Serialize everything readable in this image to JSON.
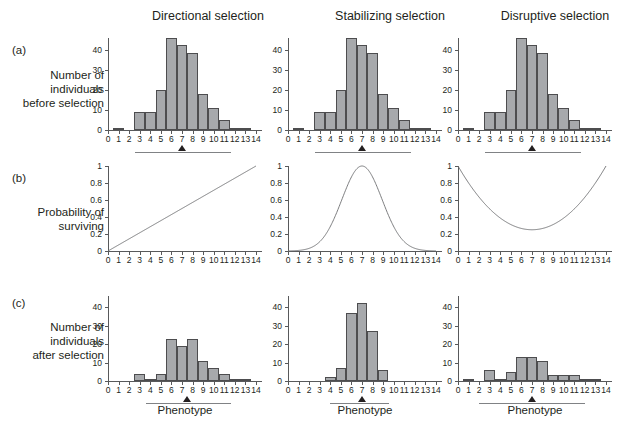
{
  "figure": {
    "columns": [
      {
        "id": "directional",
        "title": "Directional selection"
      },
      {
        "id": "stabilizing",
        "title": "Stabilizing selection"
      },
      {
        "id": "disruptive",
        "title": "Disruptive selection"
      }
    ],
    "rows": [
      {
        "tag": "(a)",
        "label_lines": [
          "Number of",
          "individuals",
          "before selection"
        ]
      },
      {
        "tag": "(b)",
        "label_lines": [
          "Probability of",
          "surviving"
        ]
      },
      {
        "tag": "(c)",
        "label_lines": [
          "Number of",
          "individuals",
          "after selection"
        ]
      }
    ],
    "xaxis_title": "Phenotype",
    "colors": {
      "bar_fill": "#a7a9ac",
      "bar_stroke": "#4d4d4f",
      "axis": "#58595b",
      "curve": "#6d6e71",
      "text": "#231f20"
    }
  },
  "chart_data": [
    {
      "id": "a-directional",
      "type": "bar",
      "title": "Directional selection",
      "row": "(a)",
      "ylabel": "Number of individuals before selection",
      "xlabel": "",
      "categories": [
        0,
        1,
        2,
        3,
        4,
        5,
        6,
        7,
        8,
        9,
        10,
        11,
        12,
        13,
        14
      ],
      "values": [
        0,
        1,
        0,
        9,
        9,
        20,
        46,
        42.5,
        38.5,
        18,
        11,
        5,
        1,
        1,
        0
      ],
      "ylim": [
        0,
        46
      ],
      "yticks": [
        0,
        10,
        20,
        30,
        40
      ],
      "mean_marker": 7,
      "range_bar": [
        2.6,
        11.6
      ],
      "grid": false
    },
    {
      "id": "a-stabilizing",
      "type": "bar",
      "title": "Stabilizing selection",
      "row": "(a)",
      "ylabel": "Number of individuals before selection",
      "xlabel": "",
      "categories": [
        0,
        1,
        2,
        3,
        4,
        5,
        6,
        7,
        8,
        9,
        10,
        11,
        12,
        13,
        14
      ],
      "values": [
        0,
        1,
        0,
        9,
        9,
        20,
        46,
        42.5,
        38.5,
        18,
        11,
        5,
        1,
        1,
        0
      ],
      "ylim": [
        0,
        46
      ],
      "yticks": [
        0,
        10,
        20,
        30,
        40
      ],
      "mean_marker": 7,
      "range_bar": [
        2.6,
        11.6
      ],
      "grid": false
    },
    {
      "id": "a-disruptive",
      "type": "bar",
      "title": "Disruptive selection",
      "row": "(a)",
      "ylabel": "Number of individuals before selection",
      "xlabel": "",
      "categories": [
        0,
        1,
        2,
        3,
        4,
        5,
        6,
        7,
        8,
        9,
        10,
        11,
        12,
        13,
        14
      ],
      "values": [
        0,
        1,
        0,
        9,
        9,
        20,
        46,
        42.5,
        38.5,
        18,
        11,
        5,
        1,
        1,
        0
      ],
      "ylim": [
        0,
        46
      ],
      "yticks": [
        0,
        10,
        20,
        30,
        40
      ],
      "mean_marker": 7,
      "range_bar": [
        2.6,
        11.6
      ],
      "grid": false
    },
    {
      "id": "b-directional",
      "type": "line",
      "title": "Directional selection",
      "row": "(b)",
      "ylabel": "Probability of surviving",
      "xlabel": "",
      "curve": "linear-increasing",
      "x": [
        0,
        1,
        2,
        3,
        4,
        5,
        6,
        7,
        8,
        9,
        10,
        11,
        12,
        13,
        14
      ],
      "values": [
        0,
        0.071,
        0.143,
        0.214,
        0.286,
        0.357,
        0.429,
        0.5,
        0.571,
        0.643,
        0.714,
        0.786,
        0.857,
        0.929,
        1.0
      ],
      "ylim": [
        0,
        1
      ],
      "yticks": [
        0,
        0.2,
        0.4,
        0.6,
        0.8,
        1
      ],
      "ytick_labels": [
        "0",
        "0.2",
        "0.4",
        "0.6",
        "0.8",
        "1"
      ],
      "grid": false
    },
    {
      "id": "b-stabilizing",
      "type": "line",
      "title": "Stabilizing selection",
      "row": "(b)",
      "ylabel": "Probability of surviving",
      "xlabel": "",
      "curve": "gaussian-peak",
      "peak_x": 7,
      "peak_y": 1.0,
      "sigma": 1.9,
      "x": [
        0,
        1,
        2,
        3,
        4,
        5,
        6,
        7,
        8,
        9,
        10,
        11,
        12,
        13,
        14
      ],
      "values": [
        0.002,
        0.012,
        0.056,
        0.175,
        0.404,
        0.714,
        0.958,
        1.0,
        0.958,
        0.714,
        0.404,
        0.175,
        0.056,
        0.012,
        0.002
      ],
      "ylim": [
        0,
        1
      ],
      "yticks": [
        0,
        0.2,
        0.4,
        0.6,
        0.8,
        1
      ],
      "ytick_labels": [
        "0",
        "0.2",
        "0.4",
        "0.6",
        "0.8",
        "1"
      ],
      "grid": false
    },
    {
      "id": "b-disruptive",
      "type": "line",
      "title": "Disruptive selection",
      "row": "(b)",
      "ylabel": "Probability of surviving",
      "xlabel": "",
      "curve": "u-shaped",
      "min_x": 7,
      "min_y": 0.25,
      "x": [
        0,
        1,
        2,
        3,
        4,
        5,
        6,
        7,
        8,
        9,
        10,
        11,
        12,
        13,
        14
      ],
      "values": [
        1.0,
        0.77,
        0.58,
        0.43,
        0.33,
        0.27,
        0.25,
        0.25,
        0.26,
        0.3,
        0.38,
        0.5,
        0.65,
        0.82,
        1.0
      ],
      "ylim": [
        0,
        1
      ],
      "yticks": [
        0,
        0.2,
        0.4,
        0.6,
        0.8,
        1
      ],
      "ytick_labels": [
        "0",
        "0.2",
        "0.4",
        "0.6",
        "0.8",
        "1"
      ],
      "grid": false
    },
    {
      "id": "c-directional",
      "type": "bar",
      "title": "Directional selection",
      "row": "(c)",
      "ylabel": "Number of individuals after selection",
      "xlabel": "Phenotype",
      "categories": [
        0,
        1,
        2,
        3,
        4,
        5,
        6,
        7,
        8,
        9,
        10,
        11,
        12,
        13,
        14
      ],
      "values": [
        0,
        0,
        0,
        4,
        1,
        4,
        23,
        19,
        23,
        11,
        7,
        4,
        1,
        1,
        0
      ],
      "ylim": [
        0,
        46
      ],
      "yticks": [
        0,
        10,
        20,
        30,
        40
      ],
      "mean_marker": 7.5,
      "range_bar": [
        3.6,
        11.6
      ],
      "grid": false
    },
    {
      "id": "c-stabilizing",
      "type": "bar",
      "title": "Stabilizing selection",
      "row": "(c)",
      "ylabel": "Number of individuals after selection",
      "xlabel": "Phenotype",
      "categories": [
        0,
        1,
        2,
        3,
        4,
        5,
        6,
        7,
        8,
        9,
        10,
        11,
        12,
        13,
        14
      ],
      "values": [
        0,
        0,
        0,
        0,
        2,
        7,
        37,
        42,
        27,
        6,
        0,
        0,
        0,
        0,
        0
      ],
      "ylim": [
        0,
        46
      ],
      "yticks": [
        0,
        10,
        20,
        30,
        40
      ],
      "mean_marker": 7,
      "range_bar": [
        4.0,
        9.6
      ],
      "grid": false
    },
    {
      "id": "c-disruptive",
      "type": "bar",
      "title": "Disruptive selection",
      "row": "(c)",
      "ylabel": "Number of individuals after selection",
      "xlabel": "Phenotype",
      "categories": [
        0,
        1,
        2,
        3,
        4,
        5,
        6,
        7,
        8,
        9,
        10,
        11,
        12,
        13,
        14
      ],
      "values": [
        0,
        1,
        0,
        6,
        1,
        5,
        13,
        13,
        11,
        3,
        3,
        3,
        1,
        1,
        0
      ],
      "ylim": [
        0,
        46
      ],
      "yticks": [
        0,
        10,
        20,
        30,
        40
      ],
      "mean_marker": 7,
      "range_bar": [
        2.0,
        12.0
      ],
      "grid": false
    }
  ]
}
